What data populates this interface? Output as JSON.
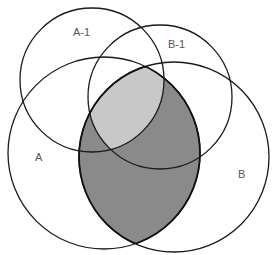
{
  "diagram": {
    "type": "venn",
    "sets": [
      {
        "id": "A-1",
        "label": "A-1",
        "cx": 92,
        "cy": 80,
        "r": 72,
        "label_x": 80,
        "label_y": 36
      },
      {
        "id": "B-1",
        "label": "B-1",
        "cx": 160,
        "cy": 97,
        "r": 72,
        "label_x": 175,
        "label_y": 48
      },
      {
        "id": "A",
        "label": "A",
        "cx": 104,
        "cy": 153,
        "r": 96,
        "label_x": 39,
        "label_y": 161
      },
      {
        "id": "B",
        "label": "B",
        "cx": 174,
        "cy": 157,
        "r": 95,
        "label_x": 242,
        "label_y": 178
      }
    ],
    "regions": [
      {
        "name": "A∩B",
        "fill": "#8a8a8a"
      },
      {
        "name": "A∩B∩A-1∩B-1",
        "fill": "#c8c8c8"
      }
    ],
    "colors": {
      "outline": "#1a1a1a",
      "label": "#555555",
      "dark_shade": "#8a8a8a",
      "light_shade": "#c8c8c8",
      "background": "#ffffff"
    }
  }
}
